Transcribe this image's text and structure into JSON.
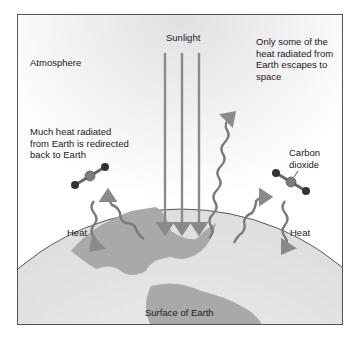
{
  "diagram": {
    "title_labels": {
      "atmosphere": "Atmosphere",
      "sunlight": "Sunlight",
      "escape_note": "Only some of the\nheat radiated from\nEarth escapes to\nspace",
      "redirect_note": "Much heat radiated\nfrom Earth is redirected\nback to Earth",
      "co2_label": "Carbon\ndioxide",
      "heat_left": "Heat",
      "heat_right": "Heat",
      "surface": "Surface of Earth"
    },
    "elements": {
      "sunlight_arrows": 3,
      "co2_molecules": 2,
      "heat_waves": 5
    },
    "colors": {
      "arrow": "#8a8a8a",
      "land": "#a9a9a9",
      "ocean": "#e6e6e6",
      "frame": "#555555",
      "molecule_center": "#7d7d7d",
      "molecule_outer": "#333333"
    }
  }
}
